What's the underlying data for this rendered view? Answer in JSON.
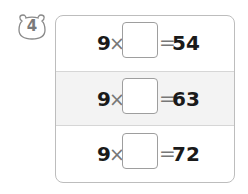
{
  "problem": {
    "number": "4"
  },
  "rows": [
    {
      "multiplicand": "9",
      "operator": "×",
      "blank": "",
      "equals": "=",
      "product": "54"
    },
    {
      "multiplicand": "9",
      "operator": "×",
      "blank": "",
      "equals": "=",
      "product": "63"
    },
    {
      "multiplicand": "9",
      "operator": "×",
      "blank": "",
      "equals": "=",
      "product": "72"
    }
  ],
  "colors": {
    "border": "#bdbdbd",
    "shaded_row": "#f3f3f3",
    "text": "#1a1a1a",
    "operator": "#777777"
  }
}
